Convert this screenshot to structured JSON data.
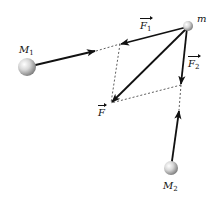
{
  "diagram": {
    "labels": {
      "m": "m",
      "M1_base": "M",
      "M1_sub": "1",
      "M2_base": "M",
      "M2_sub": "2",
      "F1_base": "F",
      "F1_sub": "1",
      "F2_base": "F",
      "F2_sub": "2",
      "F": "F"
    },
    "bodies": [
      {
        "name": "m",
        "x": 188,
        "y": 27,
        "r": 5
      },
      {
        "name": "M1",
        "x": 27,
        "y": 67,
        "r": 9
      },
      {
        "name": "M2",
        "x": 171,
        "y": 168,
        "r": 7
      }
    ],
    "vectors": [
      {
        "name": "F1",
        "from": [
          188,
          27
        ],
        "to": [
          120,
          44
        ]
      },
      {
        "name": "F2",
        "from": [
          188,
          27
        ],
        "to": [
          181,
          85
        ]
      },
      {
        "name": "F",
        "from": [
          188,
          27
        ],
        "to": [
          111,
          103
        ]
      },
      {
        "name": "M1-direction",
        "from": [
          27,
          67
        ],
        "to": [
          96,
          51
        ]
      },
      {
        "name": "M2-direction",
        "from": [
          171,
          168
        ],
        "to": [
          179,
          110
        ]
      }
    ],
    "dashed_lines": [
      {
        "from": [
          96,
          51
        ],
        "to": [
          120,
          44
        ]
      },
      {
        "from": [
          120,
          44
        ],
        "to": [
          111,
          103
        ]
      },
      {
        "from": [
          181,
          85
        ],
        "to": [
          111,
          103
        ]
      },
      {
        "from": [
          181,
          85
        ],
        "to": [
          179,
          110
        ]
      }
    ],
    "colors": {
      "stroke": "#111111",
      "sphere_light": "#f5f5f5",
      "sphere_dark": "#8a8a8a"
    }
  }
}
